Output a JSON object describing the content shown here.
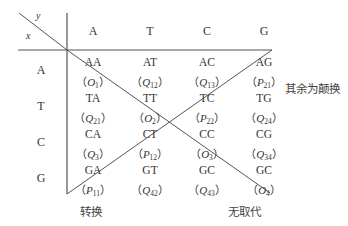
{
  "corner": {
    "top_label": "y",
    "bottom_label": "x"
  },
  "columns": [
    "A",
    "T",
    "C",
    "G"
  ],
  "rows": [
    {
      "label": "A",
      "cells": [
        {
          "pair": "AA",
          "var": "O",
          "sub": "1"
        },
        {
          "pair": "AT",
          "var": "Q",
          "sub": "12"
        },
        {
          "pair": "AC",
          "var": "Q",
          "sub": "13"
        },
        {
          "pair": "AG",
          "var": "P",
          "sub": "21"
        }
      ]
    },
    {
      "label": "T",
      "cells": [
        {
          "pair": "TA",
          "var": "Q",
          "sub": "21"
        },
        {
          "pair": "TT",
          "var": "O",
          "sub": "2"
        },
        {
          "pair": "TC",
          "var": "P",
          "sub": "22"
        },
        {
          "pair": "TG",
          "var": "Q",
          "sub": "24"
        }
      ]
    },
    {
      "label": "C",
      "cells": [
        {
          "pair": "CA",
          "var": "Q",
          "sub": "3"
        },
        {
          "pair": "CT",
          "var": "P",
          "sub": "12"
        },
        {
          "pair": "CC",
          "var": "O",
          "sub": "3"
        },
        {
          "pair": "CG",
          "var": "Q",
          "sub": "34"
        }
      ]
    },
    {
      "label": "G",
      "cells": [
        {
          "pair": "GA",
          "var": "P",
          "sub": "11"
        },
        {
          "pair": "GT",
          "var": "Q",
          "sub": "42"
        },
        {
          "pair": "GC",
          "var": "Q",
          "sub": "43"
        },
        {
          "pair": "GC",
          "var": "O",
          "sub": "4"
        }
      ]
    }
  ],
  "annotations": {
    "transition": "转换",
    "no_substitution": "无取代",
    "rest_transversion": "其余为颠换"
  },
  "paren_open": "（",
  "paren_close": "）",
  "line_color": "#555555"
}
